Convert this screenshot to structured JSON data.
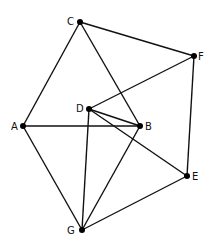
{
  "graph": {
    "nodes": [
      {
        "id": "C",
        "label": "C",
        "x": 80,
        "y": 22,
        "lx": 67,
        "ly": 25
      },
      {
        "id": "F",
        "label": "F",
        "x": 194,
        "y": 56,
        "lx": 198,
        "ly": 60
      },
      {
        "id": "D",
        "label": "D",
        "x": 89,
        "y": 109,
        "lx": 76,
        "ly": 112
      },
      {
        "id": "A",
        "label": "A",
        "x": 23,
        "y": 126,
        "lx": 11,
        "ly": 130
      },
      {
        "id": "B",
        "label": "B",
        "x": 140,
        "y": 126,
        "lx": 145,
        "ly": 130
      },
      {
        "id": "E",
        "label": "E",
        "x": 187,
        "y": 176,
        "lx": 192,
        "ly": 180
      },
      {
        "id": "G",
        "label": "G",
        "x": 82,
        "y": 230,
        "lx": 67,
        "ly": 234
      }
    ],
    "edges": [
      [
        "C",
        "F"
      ],
      [
        "C",
        "A"
      ],
      [
        "C",
        "B"
      ],
      [
        "F",
        "D"
      ],
      [
        "F",
        "E"
      ],
      [
        "D",
        "B"
      ],
      [
        "D",
        "E"
      ],
      [
        "D",
        "G"
      ],
      [
        "A",
        "B"
      ],
      [
        "A",
        "G"
      ],
      [
        "B",
        "G"
      ],
      [
        "E",
        "G"
      ]
    ]
  },
  "style": {
    "edge_color": "#111111",
    "node_color": "#000000",
    "background": "#ffffff"
  }
}
